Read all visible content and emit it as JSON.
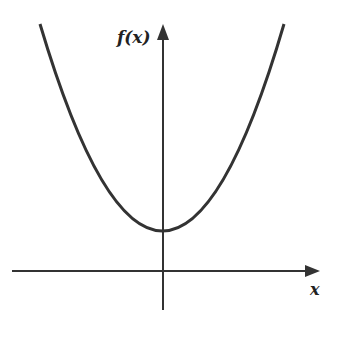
{
  "figure": {
    "type": "function-graph",
    "y_axis_label": "f(x)",
    "x_axis_label": "x",
    "line_color": "#333333"
  },
  "geometry": {
    "origin": [
      163,
      271
    ],
    "vertex": [
      163,
      231
    ],
    "curve_left_end": [
      40,
      24
    ],
    "curve_right_end": [
      284,
      24
    ],
    "x_axis": {
      "x_start": 12,
      "x_end": 318,
      "y": 271
    },
    "y_axis": {
      "x": 163,
      "y_start": 310,
      "y_end": 24
    }
  }
}
